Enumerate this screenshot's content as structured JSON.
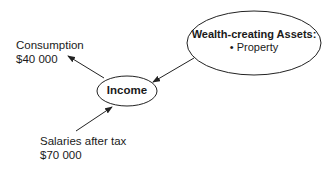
{
  "nodes": {
    "income": {
      "label": "Income"
    },
    "wealth": {
      "title": "Wealth-creating Assets:",
      "items": [
        "• Property"
      ]
    }
  },
  "labels": {
    "consumption": {
      "name": "Consumption",
      "amount": "$40 000"
    },
    "salaries": {
      "name": "Salaries after tax",
      "amount": "$70 000"
    }
  },
  "edges": [
    {
      "from": "income",
      "to": "consumption"
    },
    {
      "from": "wealth",
      "to": "income"
    },
    {
      "from": "salaries",
      "to": "income"
    }
  ],
  "colors": {
    "stroke": "#222222",
    "text": "#1a1a1a",
    "background": "#ffffff"
  }
}
